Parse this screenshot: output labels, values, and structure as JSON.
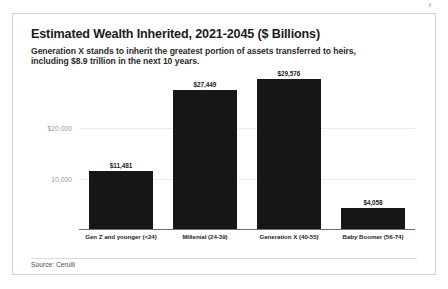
{
  "card": {
    "title": "Estimated Wealth Inherited, 2021-2045 ($ Billions)",
    "subtitle": "Generation X stands to inherit the greatest portion of assets transferred to heirs, including $8.9 trillion in the next 10 years.",
    "source": "Source: Cerulli"
  },
  "colors": {
    "bar": "#161616",
    "gridline": "#ededed",
    "axis": "#6e6e6e",
    "tick_label": "#9a9a9a",
    "card_border": "#d2d2d2",
    "page_background": "#ffffff"
  },
  "chart_data": {
    "type": "bar",
    "title": "Estimated Wealth Inherited, 2021-2045 ($ Billions)",
    "subtitle": "Generation X stands to inherit the greatest portion of assets transferred to heirs, including $8.9 trillion in the next 10 years.",
    "xlabel": "",
    "ylabel": "",
    "ylim": [
      0,
      31000
    ],
    "grid": true,
    "legend": false,
    "source": "Source: Cerulli",
    "categories": [
      "Gen Z and younger (<24)",
      "Millenial (24-39)",
      "Generation X (40-55)",
      "Baby Boomer (56-74)"
    ],
    "values": [
      11481,
      27449,
      29576,
      4058
    ],
    "value_labels": [
      "$11,481",
      "$27,449",
      "$29,576",
      "$4,058"
    ],
    "yticks": [
      10000,
      20000
    ],
    "ytick_labels": [
      "10,000",
      "$20,000"
    ]
  }
}
